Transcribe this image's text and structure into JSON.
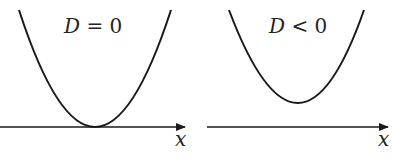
{
  "panels": [
    {
      "label_var": "D",
      "label_rel": " = 0",
      "axis_label": "x",
      "description": "parabola touching x-axis at one point"
    },
    {
      "label_var": "D",
      "label_rel": " < 0",
      "axis_label": "x",
      "description": "parabola entirely above x-axis"
    }
  ],
  "colors": {
    "stroke": "#1a1a1a",
    "background": "#ffffff"
  }
}
